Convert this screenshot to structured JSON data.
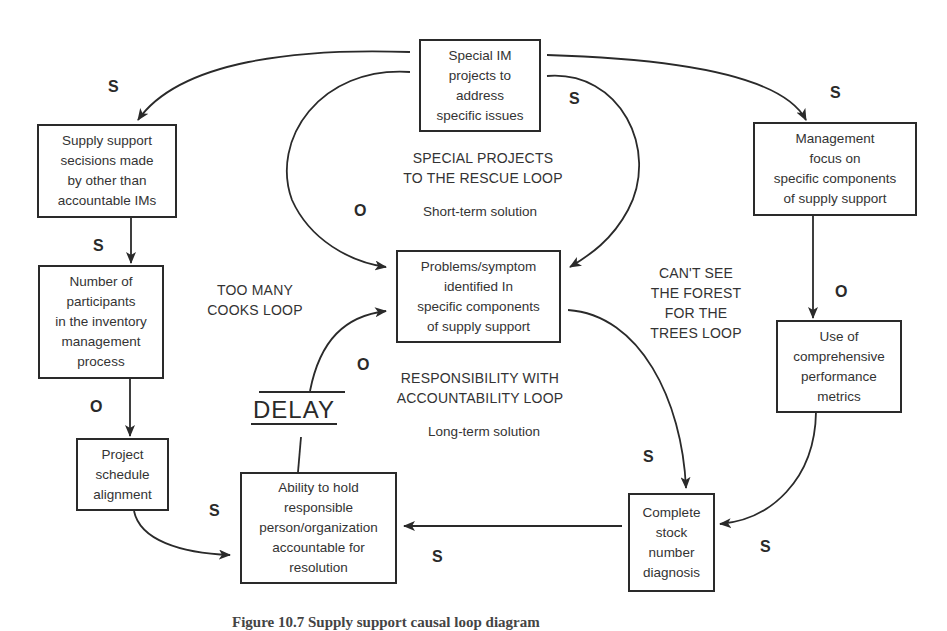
{
  "diagram": {
    "type": "causal-loop-diagram",
    "nodes": {
      "special_projects": "Special IM\nprojects to\naddress\nspecific issues",
      "supply_decisions": "Supply support\nsecisions made\nby other than\naccountable IMs",
      "participants": "Number of\nparticipants\nin the inventory\nmanagement\nprocess",
      "schedule_alignment": "Project\nschedule\nalignment",
      "accountability": "Ability to hold\nresponsible\nperson/organization\naccountable for\nresolution",
      "problems_identified": "Problems/symptom\nidentified In\nspecific components\nof supply support",
      "management_focus": "Management\nfocus on\nspecific components\nof supply support",
      "performance_metrics": "Use of\ncomprehensive\nperformance\nmetrics",
      "stock_diagnosis": "Complete\nstock\nnumber\ndiagnosis"
    },
    "loops": {
      "special_projects": "SPECIAL PROJECTS\nTO THE RESCUE LOOP",
      "too_many_cooks": "TOO MANY\nCOOKS LOOP",
      "cant_see_forest": "CAN'T SEE\nTHE FOREST\nFOR THE\nTREES LOOP",
      "responsibility": "RESPONSIBILITY WITH\nACCOUNTABILITY LOOP"
    },
    "notes": {
      "short_term": "Short-term solution",
      "long_term": "Long-term solution"
    },
    "delay_label": "DELAY",
    "polarities": {
      "special_to_supply": "S",
      "special_to_problems": "S",
      "special_to_management": "S",
      "special_loop_o": "O",
      "supply_to_participants": "S",
      "participants_to_schedule": "O",
      "schedule_to_accountability": "S",
      "accountability_to_problems": "O",
      "management_to_metrics": "O",
      "problems_to_diagnosis": "S",
      "metrics_to_diagnosis": "S",
      "diagnosis_to_accountability": "S"
    },
    "edges": [
      {
        "from": "special_projects",
        "to": "supply_decisions",
        "polarity": "S"
      },
      {
        "from": "special_projects",
        "to": "problems_identified",
        "polarity": "S",
        "via": "left arc"
      },
      {
        "from": "special_projects",
        "to": "problems_identified",
        "polarity": "S",
        "via": "right arc"
      },
      {
        "from": "special_projects",
        "to": "management_focus",
        "polarity": "S"
      },
      {
        "from": "supply_decisions",
        "to": "participants",
        "polarity": "S"
      },
      {
        "from": "participants",
        "to": "schedule_alignment",
        "polarity": "O"
      },
      {
        "from": "schedule_alignment",
        "to": "accountability",
        "polarity": "S"
      },
      {
        "from": "accountability",
        "to": "problems_identified",
        "polarity": "O",
        "delay": true
      },
      {
        "from": "management_focus",
        "to": "performance_metrics",
        "polarity": "O"
      },
      {
        "from": "problems_identified",
        "to": "stock_diagnosis",
        "polarity": "S"
      },
      {
        "from": "performance_metrics",
        "to": "stock_diagnosis",
        "polarity": "S"
      },
      {
        "from": "stock_diagnosis",
        "to": "accountability",
        "polarity": "S"
      }
    ],
    "caption": "Figure 10.7 Supply support causal loop diagram"
  },
  "colors": {
    "line": "#2a2a2a",
    "text": "#333333",
    "background": "#ffffff"
  }
}
